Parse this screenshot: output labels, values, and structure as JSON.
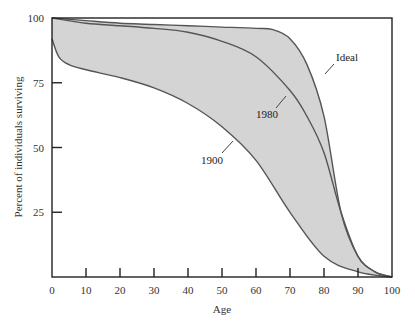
{
  "chart_data": {
    "type": "area",
    "title": "",
    "xlabel": "Age",
    "ylabel": "Percent of individuals surviving",
    "xlim": [
      0,
      100
    ],
    "ylim": [
      0,
      100
    ],
    "x_ticks": [
      0,
      10,
      20,
      30,
      40,
      50,
      60,
      70,
      80,
      90,
      100
    ],
    "y_ticks": [
      25,
      50,
      75,
      100
    ],
    "grid": false,
    "legend": "inline curve labels",
    "series": [
      {
        "name": "Ideal",
        "x": [
          0,
          10,
          20,
          30,
          40,
          50,
          60,
          65,
          70,
          75,
          80,
          85,
          90,
          95,
          100
        ],
        "values": [
          100,
          99,
          98,
          97.5,
          97,
          96.5,
          96,
          95.5,
          92,
          82,
          62,
          25,
          8,
          2,
          0
        ]
      },
      {
        "name": "1980",
        "x": [
          0,
          10,
          20,
          30,
          40,
          50,
          60,
          70,
          75,
          80,
          85,
          90,
          95,
          100
        ],
        "values": [
          100,
          98,
          97,
          96,
          94.5,
          91,
          85,
          72,
          62,
          48,
          25,
          8,
          2,
          0
        ]
      },
      {
        "name": "1900",
        "x": [
          0,
          2,
          5,
          10,
          20,
          30,
          40,
          50,
          60,
          70,
          80,
          90,
          100
        ],
        "values": [
          92,
          85,
          82,
          80,
          77,
          73,
          67,
          58,
          45,
          25,
          8,
          2,
          0
        ]
      }
    ],
    "fill": "shaded region between Ideal and 1900 curves"
  },
  "labels": {
    "x_axis": "Age",
    "y_axis": "Percent of individuals surviving",
    "curve_ideal": "Ideal",
    "curve_1980": "1980",
    "curve_1900": "1900",
    "x_ticks": [
      "0",
      "10",
      "20",
      "30",
      "40",
      "50",
      "60",
      "70",
      "80",
      "90",
      "100"
    ],
    "y_ticks": [
      "25",
      "50",
      "75",
      "100"
    ]
  },
  "colors": {
    "fill": "#d4d4d4",
    "curve": "#555555",
    "axis": "#222222"
  }
}
